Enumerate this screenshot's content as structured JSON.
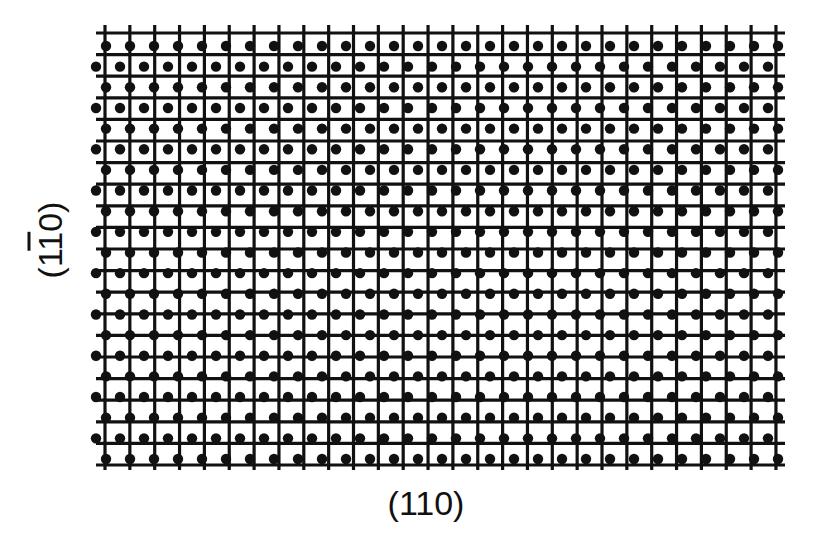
{
  "figure": {
    "x_axis_label": "(110)",
    "y_axis_label_parts": [
      "(1",
      "1",
      "0)"
    ],
    "y_axis_label_overbar_index": 1,
    "ink_color": "#111111",
    "background_color": "#ffffff"
  },
  "grid": {
    "vertical_lines": {
      "count": 28,
      "x_start": 105,
      "x_step": 24.85,
      "y_top": 25,
      "y_bottom": 470
    },
    "horizontal_lines": {
      "count": 21,
      "y_start": 33,
      "y_step": 21.6,
      "x_left": 96,
      "x_right": 785
    },
    "stroke_width": 3.2
  },
  "dot_lattice": {
    "rows": 21,
    "y_start": 46,
    "y_step": 20.65,
    "cols": 29,
    "x_step": 24.0,
    "even_row_x_start": 106,
    "odd_row_x_start": 96,
    "x_max": 790,
    "radius": 5.2
  }
}
